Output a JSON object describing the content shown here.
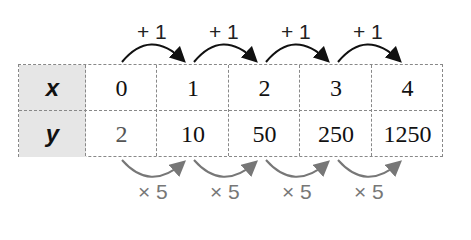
{
  "table": {
    "rows": [
      {
        "header": "x",
        "values": [
          "0",
          "1",
          "2",
          "3",
          "4"
        ]
      },
      {
        "header": "y",
        "values": [
          "2",
          "10",
          "50",
          "250",
          "1250"
        ]
      }
    ]
  },
  "annotations": {
    "top": [
      "+ 1",
      "+ 1",
      "+ 1",
      "+ 1"
    ],
    "bottom": [
      "× 5",
      "× 5",
      "× 5",
      "× 5"
    ]
  },
  "colors": {
    "top_arrow": "#111111",
    "bottom_arrow": "#777777",
    "header_fill": "#e6e6e6"
  }
}
